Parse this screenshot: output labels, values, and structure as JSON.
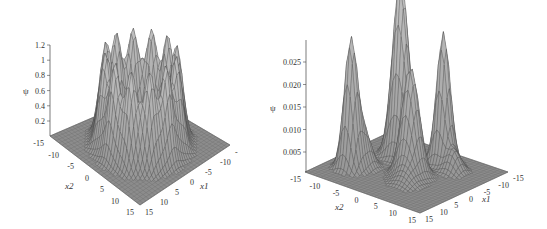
{
  "chart_data": [
    {
      "type": "surface3d",
      "title": "",
      "zlabel": "ψ",
      "xlabel": "x1",
      "ylabel": "x2",
      "zlim": [
        0,
        1.2
      ],
      "z_ticks": [
        "0.2",
        "0.4",
        "0.6",
        "0.8",
        "1",
        "1.2"
      ],
      "x1_ticks": [
        "-10",
        "-5",
        "0",
        "5",
        "10",
        "15"
      ],
      "x2_ticks": [
        "-15",
        "-10",
        "-5",
        "0",
        "5",
        "10",
        "15"
      ],
      "x1_range": [
        -15,
        15
      ],
      "x2_range": [
        -15,
        15
      ],
      "description": "Ring of sharp peaks (~1.0–1.2 high) arranged in a circular crater around the origin; flat base near 0 outside",
      "peak_max": 1.2,
      "surface_color": "#9a9a9a"
    },
    {
      "type": "surface3d",
      "title": "",
      "zlabel": "ψ",
      "xlabel": "x1",
      "ylabel": "x2",
      "zlim": [
        0,
        0.028
      ],
      "z_ticks": [
        "0.005",
        "0.010",
        "0.015",
        "0.020",
        "0.025"
      ],
      "x1_ticks": [
        "-15",
        "-10",
        "-5",
        "0",
        "5",
        "10",
        "15"
      ],
      "x2_ticks": [
        "-15",
        "-10",
        "-5",
        "0",
        "5",
        "10",
        "15"
      ],
      "x1_range": [
        -15,
        15
      ],
      "x2_range": [
        -15,
        15
      ],
      "description": "Four localized sharp peaks (~0.028 max) at quadrant positions plus smaller secondary bumps; flat base elsewhere",
      "peak_max": 0.028,
      "surface_color": "#9a9a9a"
    }
  ],
  "left": {
    "zlabel": "ψ",
    "z_ticks": [
      "1.2",
      "1",
      "0.8",
      "0.6",
      "0.4",
      "0.2"
    ],
    "x2_ticks": [
      "-15",
      "-10",
      "-5",
      "0",
      "5",
      "10",
      "15"
    ],
    "x1_ticks": [
      "-",
      "-10",
      "-5",
      "0",
      "5",
      "10",
      "15"
    ],
    "x1_label": "x1",
    "x2_label": "x2"
  },
  "right": {
    "zlabel": "ψ",
    "z_ticks": [
      "0.025",
      "0.020",
      "0.015",
      "0.010",
      "0.005"
    ],
    "x2_ticks": [
      "-15",
      "-10",
      "-5",
      "0",
      "5",
      "10",
      "15"
    ],
    "x1_ticks": [
      "-15",
      "-10",
      "-5",
      "0",
      "5",
      "10",
      "15"
    ],
    "x1_label": "x1",
    "x2_label": "x2"
  }
}
